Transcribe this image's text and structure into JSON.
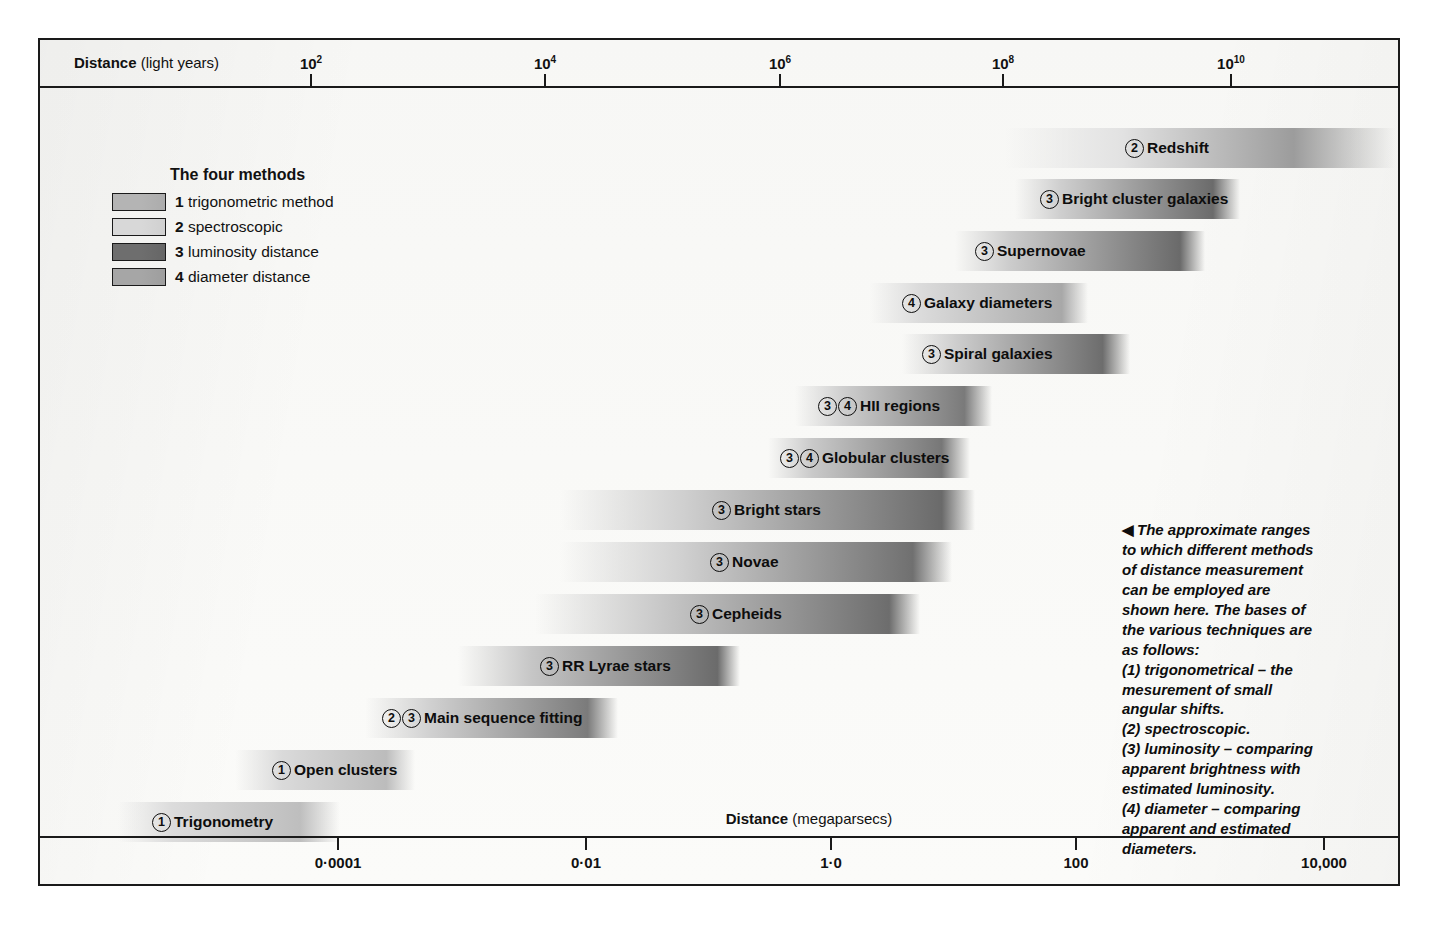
{
  "axes": {
    "top": {
      "title": "Distance",
      "unit": "(light years)",
      "ticks": [
        {
          "label": "10",
          "exp": "2",
          "x": 270
        },
        {
          "label": "10",
          "exp": "4",
          "x": 504
        },
        {
          "label": "10",
          "exp": "6",
          "x": 739
        },
        {
          "label": "10",
          "exp": "8",
          "x": 962
        },
        {
          "label": "10",
          "exp": "10",
          "x": 1190
        }
      ]
    },
    "bottom": {
      "title": "Distance",
      "unit": "(megaparsecs)",
      "ticks": [
        {
          "label": "0·0001",
          "x": 297
        },
        {
          "label": "0·01",
          "x": 545
        },
        {
          "label": "1·0",
          "x": 790
        },
        {
          "label": "100",
          "x": 1035
        },
        {
          "label": "10,000",
          "x": 1283
        }
      ]
    }
  },
  "legend": {
    "title": "The four methods",
    "items": [
      {
        "number": "1",
        "label": "trigonometric method",
        "color": "#b4b4b4"
      },
      {
        "number": "2",
        "label": "spectroscopic",
        "color": "#d8d8d8"
      },
      {
        "number": "3",
        "label": "luminosity distance",
        "color": "#6e6e6e"
      },
      {
        "number": "4",
        "label": "diameter distance",
        "color": "#a6a6a6"
      }
    ]
  },
  "caption": {
    "arrow": "◀",
    "lines": [
      "The approximate ranges",
      "to which different methods",
      "of distance measurement",
      "can be employed are",
      "shown here. The bases of",
      "the various techniques are",
      "as follows:",
      "(1) trigonometrical – the",
      "mesurement of small",
      "angular shifts.",
      "(2) spectroscopic.",
      "(3) luminosity – comparing",
      "apparent brightness with",
      "estimated luminosity.",
      "(4) diameter – comparing",
      "apparent and estimated",
      "diameters."
    ]
  },
  "chart_data": {
    "type": "bar",
    "orientation": "horizontal",
    "xlabel_top": "Distance (light years)",
    "xlabel_bottom": "Distance (megaparsecs)",
    "x_scale": "log",
    "grid": false,
    "legend_position": "top-left",
    "categories": [
      "Redshift",
      "Bright cluster galaxies",
      "Supernovae",
      "Galaxy diameters",
      "Spiral galaxies",
      "HII regions",
      "Globular clusters",
      "Bright stars",
      "Novae",
      "Cepheids",
      "RR Lyrae stars",
      "Main sequence fitting",
      "Open clusters",
      "Trigonometry"
    ],
    "bars": [
      {
        "name": "Redshift",
        "methods": [
          "2"
        ],
        "x_start_px": 965,
        "x_end_px": 1355,
        "y_px": 40,
        "light_years_start": 30000000.0,
        "light_years_end": 200000000000.0,
        "megaparsecs_start": 10,
        "megaparsecs_end": 60000,
        "color_light": "#e2e2e2",
        "color_dark": "#9c9c9c",
        "fade_left": 0.3,
        "fade_right": 0.26,
        "label_x_px": 1085
      },
      {
        "name": "Bright cluster galaxies",
        "methods": [
          "3"
        ],
        "x_start_px": 975,
        "x_end_px": 1200,
        "y_px": 91,
        "light_years_start": 40000000.0,
        "light_years_end": 30000000000.0,
        "megaparsecs_start": 12,
        "megaparsecs_end": 9000,
        "color_light": "#cfcfcf",
        "color_dark": "#6b6b6b",
        "fade_left": 0.2,
        "fade_right": 0.12,
        "label_x_px": 1000
      },
      {
        "name": "Supernovae",
        "methods": [
          "3"
        ],
        "x_start_px": 915,
        "x_end_px": 1165,
        "y_px": 143,
        "light_years_start": 10000000.0,
        "light_years_end": 10000000000.0,
        "megaparsecs_start": 3,
        "megaparsecs_end": 3000,
        "color_light": "#cccccc",
        "color_dark": "#6a6a6a",
        "fade_left": 0.22,
        "fade_right": 0.1,
        "label_x_px": 935
      },
      {
        "name": "Galaxy diameters",
        "methods": [
          "4"
        ],
        "x_start_px": 830,
        "x_end_px": 1048,
        "y_px": 195,
        "light_years_start": 2000000.0,
        "light_years_end": 1500000000.0,
        "megaparsecs_start": 0.6,
        "megaparsecs_end": 450,
        "color_light": "#dcdcdc",
        "color_dark": "#a8a8a8",
        "fade_left": 0.22,
        "fade_right": 0.12,
        "label_x_px": 862
      },
      {
        "name": "Spiral galaxies",
        "methods": [
          "3"
        ],
        "x_start_px": 862,
        "x_end_px": 1090,
        "y_px": 246,
        "light_years_start": 5000000.0,
        "light_years_end": 4000000000.0,
        "megaparsecs_start": 1.5,
        "megaparsecs_end": 1200,
        "color_light": "#cdcdcd",
        "color_dark": "#6d6d6d",
        "fade_left": 0.24,
        "fade_right": 0.12,
        "label_x_px": 882
      },
      {
        "name": "HII regions",
        "methods": [
          "3",
          "4"
        ],
        "x_start_px": 755,
        "x_end_px": 952,
        "y_px": 298,
        "light_years_start": 300000.0,
        "light_years_end": 200000000.0,
        "megaparsecs_start": 0.09,
        "megaparsecs_end": 60,
        "color_light": "#cfcfcf",
        "color_dark": "#7a7a7a",
        "fade_left": 0.24,
        "fade_right": 0.14,
        "label_x_px": 778
      },
      {
        "name": "Globular clusters",
        "methods": [
          "3",
          "4"
        ],
        "x_start_px": 728,
        "x_end_px": 930,
        "y_px": 350,
        "light_years_start": 150000.0,
        "light_years_end": 100000000.0,
        "megaparsecs_start": 0.045,
        "megaparsecs_end": 30,
        "color_light": "#c9c9c9",
        "color_dark": "#777777",
        "fade_left": 0.22,
        "fade_right": 0.14,
        "label_x_px": 740
      },
      {
        "name": "Bright stars",
        "methods": [
          "3"
        ],
        "x_start_px": 520,
        "x_end_px": 935,
        "y_px": 402,
        "light_years_start": 300,
        "light_years_end": 120000000.0,
        "megaparsecs_start": 0.0001,
        "megaparsecs_end": 35,
        "color_light": "#cfcfcf",
        "color_dark": "#6a6a6a",
        "fade_left": 0.3,
        "fade_right": 0.08,
        "label_x_px": 672
      },
      {
        "name": "Novae",
        "methods": [
          "3"
        ],
        "x_start_px": 520,
        "x_end_px": 912,
        "y_px": 454,
        "light_years_start": 300,
        "light_years_end": 70000000.0,
        "megaparsecs_start": 0.0001,
        "megaparsecs_end": 20,
        "color_light": "#d2d2d2",
        "color_dark": "#707070",
        "fade_left": 0.3,
        "fade_right": 0.1,
        "label_x_px": 670
      },
      {
        "name": "Cepheids",
        "methods": [
          "3"
        ],
        "x_start_px": 495,
        "x_end_px": 880,
        "y_px": 506,
        "light_years_start": 150,
        "light_years_end": 30000000.0,
        "megaparsecs_start": 5e-05,
        "megaparsecs_end": 10,
        "color_light": "#cccccc",
        "color_dark": "#6d6d6d",
        "fade_left": 0.3,
        "fade_right": 0.08,
        "label_x_px": 650
      },
      {
        "name": "RR Lyrae stars",
        "methods": [
          "3"
        ],
        "x_start_px": 418,
        "x_end_px": 700,
        "y_px": 558,
        "light_years_start": 25,
        "light_years_end": 500000.0,
        "megaparsecs_start": 8e-06,
        "megaparsecs_end": 0.16,
        "color_light": "#c6c6c6",
        "color_dark": "#6b6b6b",
        "fade_left": 0.26,
        "fade_right": 0.08,
        "label_x_px": 500
      },
      {
        "name": "Main sequence fitting",
        "methods": [
          "2",
          "3"
        ],
        "x_start_px": 325,
        "x_end_px": 578,
        "y_px": 610,
        "light_years_start": 3,
        "light_years_end": 30000.0,
        "megaparsecs_start": 1e-06,
        "megaparsecs_end": 0.01,
        "color_light": "#d0d0d0",
        "color_dark": "#7b7b7b",
        "fade_left": 0.26,
        "fade_right": 0.12,
        "label_x_px": 342
      },
      {
        "name": "Open clusters",
        "methods": [
          "1"
        ],
        "x_start_px": 195,
        "x_end_px": 375,
        "y_px": 662,
        "light_years_start": 0.2,
        "light_years_end": 300,
        "megaparsecs_start": 6e-08,
        "megaparsecs_end": 0.0001,
        "color_light": "#dadada",
        "color_dark": "#bcbcbc",
        "fade_left": 0.26,
        "fade_right": 0.16,
        "label_x_px": 232
      },
      {
        "name": "Trigonometry",
        "methods": [
          "1"
        ],
        "x_start_px": 78,
        "x_end_px": 300,
        "y_px": 714,
        "light_years_start": 0.05,
        "light_years_end": 200,
        "megaparsecs_start": 2e-08,
        "megaparsecs_end": 6e-05,
        "color_light": "#dcdcdc",
        "color_dark": "#bebebe",
        "fade_left": 0.24,
        "fade_right": 0.18,
        "label_x_px": 112
      }
    ]
  }
}
